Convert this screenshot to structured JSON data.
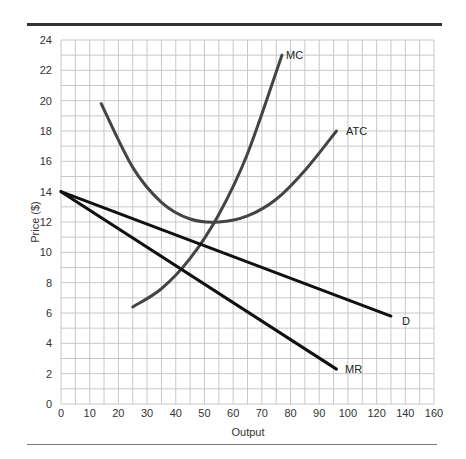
{
  "chart_data": {
    "type": "line",
    "title": "",
    "xlabel": "Output",
    "ylabel": "Price ($)",
    "xlim": [
      0,
      160
    ],
    "ylim": [
      0,
      24
    ],
    "grid": true,
    "x_ticks": [
      "0",
      "10",
      "20",
      "30",
      "40",
      "50",
      "60",
      "70",
      "80",
      "90",
      "100",
      "120",
      "140",
      "160"
    ],
    "y_ticks": [
      "0",
      "2",
      "4",
      "6",
      "8",
      "10",
      "12",
      "14",
      "16",
      "18",
      "20",
      "22",
      "24"
    ],
    "series": [
      {
        "name": "MC",
        "color": "#444444",
        "points": [
          [
            25,
            6.4
          ],
          [
            35,
            7.6
          ],
          [
            45,
            9.6
          ],
          [
            55,
            12.5
          ],
          [
            65,
            16.5
          ],
          [
            77,
            23
          ]
        ]
      },
      {
        "name": "ATC",
        "color": "#444444",
        "points": [
          [
            14,
            19.8
          ],
          [
            25,
            15.6
          ],
          [
            35,
            13.3
          ],
          [
            45,
            12.2
          ],
          [
            55,
            12
          ],
          [
            65,
            12.4
          ],
          [
            75,
            13.5
          ],
          [
            85,
            15.4
          ],
          [
            96,
            18
          ]
        ]
      },
      {
        "name": "D",
        "color": "#111111",
        "points": [
          [
            0,
            14
          ],
          [
            130,
            5.8
          ]
        ]
      },
      {
        "name": "MR",
        "color": "#111111",
        "points": [
          [
            0,
            14
          ],
          [
            96,
            2.3
          ]
        ]
      }
    ],
    "labels": [
      {
        "text": "MC",
        "x": 78,
        "y": 23
      },
      {
        "text": "ATC",
        "x": 98,
        "y": 18
      },
      {
        "text": "D",
        "x": 132,
        "y": 5.8
      },
      {
        "text": "MR",
        "x": 98,
        "y": 2.3
      }
    ]
  },
  "axes": {
    "xlabel": "Output",
    "ylabel": "Price ($)"
  },
  "curve_labels": {
    "mc": "MC",
    "atc": "ATC",
    "d": "D",
    "mr": "MR"
  },
  "ticks": {
    "x": [
      "0",
      "10",
      "20",
      "30",
      "40",
      "50",
      "60",
      "70",
      "80",
      "90",
      "100",
      "120",
      "140",
      "160"
    ],
    "y": [
      "0",
      "2",
      "4",
      "6",
      "8",
      "10",
      "12",
      "14",
      "16",
      "18",
      "20",
      "22",
      "24"
    ]
  }
}
